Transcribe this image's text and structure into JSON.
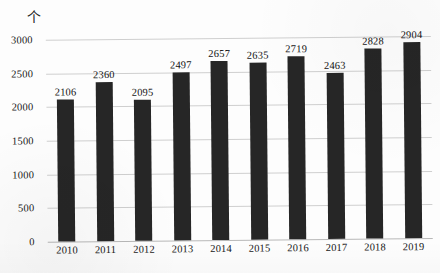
{
  "chart_data": {
    "type": "bar",
    "title": "",
    "subtitle": "",
    "xlabel": "",
    "ylabel": "",
    "unit_label": "个",
    "categories": [
      "2010",
      "2011",
      "2012",
      "2013",
      "2014",
      "2015",
      "2016",
      "2017",
      "2018",
      "2019"
    ],
    "values": [
      2106,
      2360,
      2095,
      2497,
      2657,
      2635,
      2719,
      2463,
      2828,
      2904
    ],
    "ylim": [
      0,
      3000
    ],
    "yticks": [
      0,
      500,
      1000,
      1500,
      2000,
      2500,
      3000
    ],
    "ytick_labels": [
      "0",
      "500",
      "1000",
      "1500",
      "2000",
      "2500",
      "3000"
    ],
    "grid": true,
    "legend": false,
    "data_labels": true,
    "series": [
      {
        "name": "",
        "values": [
          2106,
          2360,
          2095,
          2497,
          2657,
          2635,
          2719,
          2463,
          2828,
          2904
        ],
        "color": "#262626"
      }
    ],
    "colors": {
      "bar": "#262626",
      "gridline": "#cfcfcf",
      "axis": "#b8b8b8",
      "text": "#171717",
      "background": "#fdfdfd"
    }
  }
}
